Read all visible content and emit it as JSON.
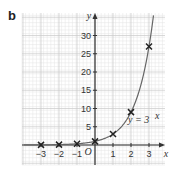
{
  "part_label": "b",
  "chart_data": {
    "type": "line",
    "title": "",
    "xlabel": "x",
    "ylabel": "y",
    "origin_label": "O",
    "xlim": [
      -4,
      3.8
    ],
    "ylim": [
      -5.5,
      36
    ],
    "x_ticks": [
      -3,
      -2,
      -1,
      1,
      2,
      3
    ],
    "x_tick_labels": [
      "−3",
      "−2",
      "−1",
      "1",
      "2",
      "3"
    ],
    "y_ticks": [
      5,
      10,
      15,
      20,
      25,
      30
    ],
    "y_tick_labels": [
      "5",
      "10",
      "15",
      "20",
      "25",
      "30"
    ],
    "grid": true,
    "curve": {
      "name": "y = 3^x",
      "label": "y = 3",
      "label_exponent": "x",
      "base": 3
    },
    "points": [
      {
        "x": -3,
        "y": 0.037
      },
      {
        "x": -2,
        "y": 0.111
      },
      {
        "x": -1,
        "y": 0.333
      },
      {
        "x": 0,
        "y": 1
      },
      {
        "x": 1,
        "y": 3
      },
      {
        "x": 2,
        "y": 9
      },
      {
        "x": 3,
        "y": 27
      }
    ],
    "marker": "cross",
    "colors": {
      "curve": "#666666",
      "marker": "#222222",
      "grid_major": "#c8c8c8",
      "grid_minor": "#e4e4e4",
      "axis": "#333333"
    }
  }
}
